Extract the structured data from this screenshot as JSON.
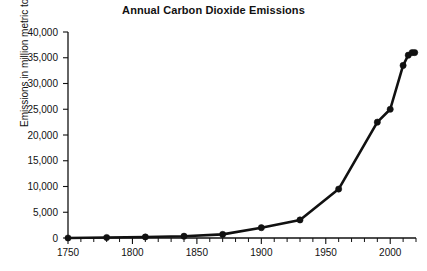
{
  "chart_data": {
    "type": "line",
    "title": "Annual Carbon Dioxide Emissions",
    "xlabel": "",
    "ylabel": "Emissions in million metric tons",
    "xlim": [
      1750,
      2020
    ],
    "ylim": [
      0,
      40000
    ],
    "ytick_labels": [
      "0",
      "5,000",
      "10,000",
      "15,000",
      "20,000",
      "25,000",
      "30,000",
      "35,000",
      "40,000"
    ],
    "ytick_values": [
      0,
      5000,
      10000,
      15000,
      20000,
      25000,
      30000,
      35000,
      40000
    ],
    "xtick_labels": [
      "1750",
      "1800",
      "1850",
      "1900",
      "1950",
      "2000"
    ],
    "xtick_values": [
      1750,
      1800,
      1850,
      1900,
      1950,
      2000
    ],
    "x_minor_step": 10,
    "grid": false,
    "legend": false,
    "marker": "filled-circle",
    "line_color": "#111111",
    "marker_color": "#111111",
    "x": [
      1750,
      1780,
      1810,
      1840,
      1870,
      1900,
      1930,
      1960,
      1990,
      2000,
      2010,
      2014,
      2017,
      2019
    ],
    "values": [
      0,
      100,
      200,
      350,
      700,
      2000,
      3500,
      9500,
      22500,
      25000,
      33500,
      35500,
      36000,
      36000
    ],
    "series": [
      {
        "name": "Annual CO2 emissions",
        "values": [
          0,
          100,
          200,
          350,
          700,
          2000,
          3500,
          9500,
          22500,
          25000,
          33500,
          35500,
          36000,
          36000
        ]
      }
    ]
  }
}
